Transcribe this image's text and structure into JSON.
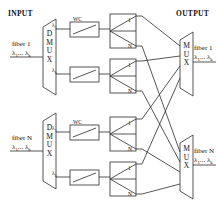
{
  "figure": {
    "line_color": "#2b2b2b",
    "text_color": "#111111",
    "background": "#ffffff"
  },
  "headers": {
    "input": "INPUT",
    "output": "OUTPUT"
  },
  "input_fibers": [
    {
      "id": "fiber-1",
      "name": "fiber 1",
      "wavelengths": "λ1... λk",
      "lambda_first": "λ",
      "lambda_first_sub": "1",
      "lambda_last": "λ",
      "lambda_last_sub": "k",
      "demux_label": "DMUX",
      "demux_letters": [
        "D",
        "M",
        "U",
        "X"
      ]
    },
    {
      "id": "fiber-N",
      "name": "fiber N",
      "wavelengths": "λ1... λk",
      "lambda_first": "λ",
      "lambda_first_sub": "1",
      "lambda_last": "λ",
      "lambda_last_sub": "k",
      "demux_label": "DMUX",
      "demux_letters": [
        "D",
        "M",
        "U",
        "X"
      ]
    }
  ],
  "output_fibers": [
    {
      "id": "out-fiber-1",
      "name": "fiber 1",
      "wavelengths": "λ1... λk",
      "lambda_first": "λ",
      "lambda_first_sub": "1",
      "lambda_last": "λ",
      "lambda_last_sub": "k",
      "mux_label": "MUX",
      "mux_letters": [
        "M",
        "U",
        "X"
      ]
    },
    {
      "id": "out-fiber-N",
      "name": "fiber N",
      "wavelengths": "λ1... λk",
      "lambda_first": "λ",
      "lambda_first_sub": "1",
      "lambda_last": "λ",
      "lambda_last_sub": "k",
      "mux_label": "MUX",
      "mux_letters": [
        "M",
        "U",
        "X"
      ]
    }
  ],
  "branches": [
    {
      "id": "branch-f1-l1",
      "tap_lambda": "λ",
      "tap_sub": "1",
      "wc_label": "WC",
      "switch_top_port": "1",
      "switch_bottom_port": "N"
    },
    {
      "id": "branch-f1-lk",
      "tap_lambda": "λ",
      "tap_sub": "k",
      "wc_label": "",
      "switch_top_port": "1",
      "switch_bottom_port": "N"
    },
    {
      "id": "branch-fN-l1",
      "tap_lambda": "λ",
      "tap_sub": "1",
      "wc_label": "WC",
      "switch_top_port": "1",
      "switch_bottom_port": "N"
    },
    {
      "id": "branch-fN-lk",
      "tap_lambda": "λ",
      "tap_sub": "k",
      "wc_label": "",
      "switch_top_port": "1",
      "switch_bottom_port": "N"
    }
  ],
  "components": {
    "wavelength_converter": "WC",
    "demultiplexer": "DMUX",
    "multiplexer": "MUX",
    "space_switch": "1xN switch"
  }
}
